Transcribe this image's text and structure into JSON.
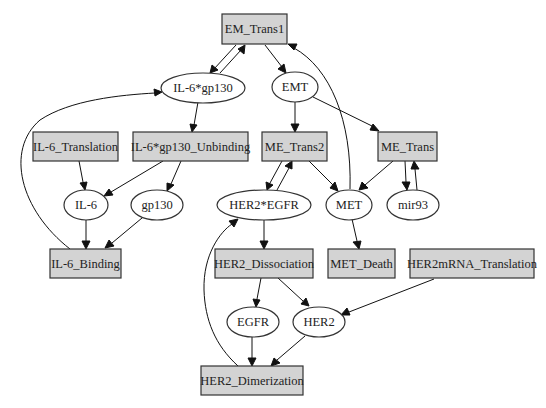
{
  "diagram": {
    "type": "directed-graph",
    "colors": {
      "rect_fill": "#d3d3d3",
      "ellipse_fill": "#ffffff",
      "stroke": "#333333",
      "background": "#ffffff"
    },
    "nodes": [
      {
        "id": "EM_Trans1",
        "label": "EM_Trans1",
        "shape": "box"
      },
      {
        "id": "IL6gp130",
        "label": "IL-6*gp130",
        "shape": "ellipse"
      },
      {
        "id": "EMT",
        "label": "EMT",
        "shape": "ellipse"
      },
      {
        "id": "IL6_Translation",
        "label": "IL-6_Translation",
        "shape": "box"
      },
      {
        "id": "IL6gp130_Unbinding",
        "label": "IL-6*gp130_Unbinding",
        "shape": "box"
      },
      {
        "id": "ME_Trans2",
        "label": "ME_Trans2",
        "shape": "box"
      },
      {
        "id": "ME_Trans",
        "label": "ME_Trans",
        "shape": "box"
      },
      {
        "id": "IL6",
        "label": "IL-6",
        "shape": "ellipse"
      },
      {
        "id": "gp130",
        "label": "gp130",
        "shape": "ellipse"
      },
      {
        "id": "HER2EGFR",
        "label": "HER2*EGFR",
        "shape": "ellipse"
      },
      {
        "id": "MET",
        "label": "MET",
        "shape": "ellipse"
      },
      {
        "id": "mir93",
        "label": "mir93",
        "shape": "ellipse"
      },
      {
        "id": "IL6_Binding",
        "label": "IL-6_Binding",
        "shape": "box"
      },
      {
        "id": "HER2_Dissociation",
        "label": "HER2_Dissociation",
        "shape": "box"
      },
      {
        "id": "MET_Death",
        "label": "MET_Death",
        "shape": "box"
      },
      {
        "id": "HER2mRNA_Translation",
        "label": "HER2mRNA_Translation",
        "shape": "box"
      },
      {
        "id": "EGFR",
        "label": "EGFR",
        "shape": "ellipse"
      },
      {
        "id": "HER2",
        "label": "HER2",
        "shape": "ellipse"
      },
      {
        "id": "HER2_Dimerization",
        "label": "HER2_Dimerization",
        "shape": "box"
      }
    ],
    "edges": [
      {
        "from": "EM_Trans1",
        "to": "IL6gp130"
      },
      {
        "from": "IL6gp130",
        "to": "EM_Trans1"
      },
      {
        "from": "EM_Trans1",
        "to": "EMT"
      },
      {
        "from": "MET",
        "to": "EM_Trans1"
      },
      {
        "from": "IL6gp130",
        "to": "IL6gp130_Unbinding"
      },
      {
        "from": "IL6_Binding",
        "to": "IL6gp130"
      },
      {
        "from": "EMT",
        "to": "ME_Trans2"
      },
      {
        "from": "EMT",
        "to": "ME_Trans"
      },
      {
        "from": "IL6_Translation",
        "to": "IL6"
      },
      {
        "from": "IL6gp130_Unbinding",
        "to": "IL6"
      },
      {
        "from": "IL6gp130_Unbinding",
        "to": "gp130"
      },
      {
        "from": "ME_Trans2",
        "to": "HER2EGFR"
      },
      {
        "from": "HER2EGFR",
        "to": "ME_Trans2"
      },
      {
        "from": "ME_Trans2",
        "to": "MET"
      },
      {
        "from": "ME_Trans",
        "to": "MET"
      },
      {
        "from": "ME_Trans",
        "to": "mir93"
      },
      {
        "from": "mir93",
        "to": "ME_Trans"
      },
      {
        "from": "IL6",
        "to": "IL6_Binding"
      },
      {
        "from": "gp130",
        "to": "IL6_Binding"
      },
      {
        "from": "HER2EGFR",
        "to": "HER2_Dissociation"
      },
      {
        "from": "MET",
        "to": "MET_Death"
      },
      {
        "from": "HER2_Dissociation",
        "to": "EGFR"
      },
      {
        "from": "HER2_Dissociation",
        "to": "HER2"
      },
      {
        "from": "HER2mRNA_Translation",
        "to": "HER2"
      },
      {
        "from": "EGFR",
        "to": "HER2_Dimerization"
      },
      {
        "from": "HER2",
        "to": "HER2_Dimerization"
      },
      {
        "from": "HER2_Dimerization",
        "to": "HER2EGFR"
      }
    ]
  }
}
